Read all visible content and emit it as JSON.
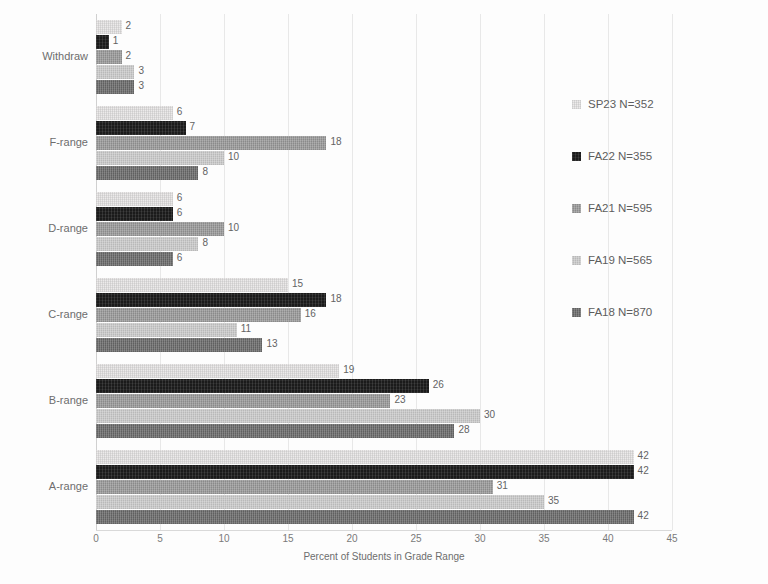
{
  "chart_data": {
    "type": "bar",
    "orientation": "horizontal",
    "title": "",
    "xlabel": "Percent of Students in Grade Range",
    "ylabel": "",
    "xlim": [
      0,
      45
    ],
    "xticks": [
      0,
      5,
      10,
      15,
      20,
      25,
      30,
      35,
      40,
      45
    ],
    "grid": true,
    "legend_position": "right",
    "categories": [
      "Withdraw",
      "F-range",
      "D-range",
      "C-range",
      "B-range",
      "A-range"
    ],
    "series": [
      {
        "name": "SP23 N=352",
        "color": "#eceaea",
        "values": [
          2,
          6,
          6,
          15,
          19,
          42
        ]
      },
      {
        "name": "FA22 N=355",
        "color": "#1b1b1b",
        "values": [
          1,
          7,
          6,
          18,
          26,
          42
        ]
      },
      {
        "name": "FA21 N=595",
        "color": "#9a9a9a",
        "values": [
          2,
          18,
          10,
          16,
          23,
          31
        ]
      },
      {
        "name": "FA19 N=565",
        "color": "#c7c7c7",
        "values": [
          3,
          10,
          8,
          11,
          30,
          35
        ]
      },
      {
        "name": "FA18 N=870",
        "color": "#6d6d6d",
        "values": [
          3,
          8,
          6,
          13,
          28,
          42
        ]
      }
    ]
  },
  "legend": {
    "items": [
      {
        "label": "SP23 N=352"
      },
      {
        "label": "FA22 N=355"
      },
      {
        "label": "FA21 N=595"
      },
      {
        "label": "FA19 N=565"
      },
      {
        "label": "FA18 N=870"
      }
    ]
  }
}
